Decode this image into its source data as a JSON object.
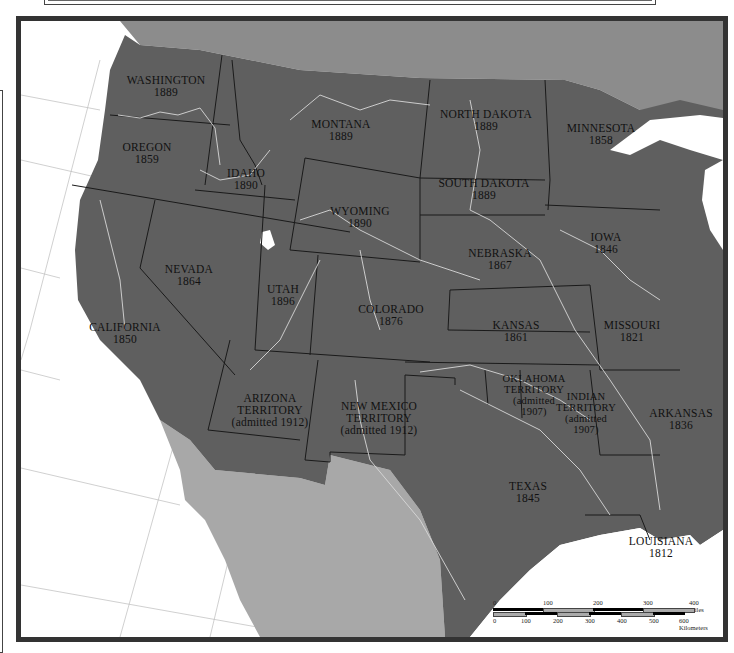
{
  "map": {
    "colors": {
      "us_land": "#5f5f5f",
      "canada_land": "#8c8c8c",
      "mexico_land": "#a8a8a8",
      "water": "#ffffff",
      "border": "#1a1a1a",
      "river": "#d8d8d8",
      "frame": "#333333"
    },
    "states": [
      {
        "id": "washington",
        "name": "WASHINGTON",
        "year": "1889"
      },
      {
        "id": "oregon",
        "name": "OREGON",
        "year": "1859"
      },
      {
        "id": "idaho",
        "name": "IDAHO",
        "year": "1890"
      },
      {
        "id": "montana",
        "name": "MONTANA",
        "year": "1889"
      },
      {
        "id": "north-dakota",
        "name": "NORTH DAKOTA",
        "year": "1889"
      },
      {
        "id": "minnesota",
        "name": "MINNESOTA",
        "year": "1858"
      },
      {
        "id": "south-dakota",
        "name": "SOUTH DAKOTA",
        "year": "1889"
      },
      {
        "id": "wyoming",
        "name": "WYOMING",
        "year": "1890"
      },
      {
        "id": "nevada",
        "name": "NEVADA",
        "year": "1864"
      },
      {
        "id": "utah",
        "name": "UTAH",
        "year": "1896"
      },
      {
        "id": "nebraska",
        "name": "NEBRASKA",
        "year": "1867"
      },
      {
        "id": "iowa",
        "name": "IOWA",
        "year": "1846"
      },
      {
        "id": "california",
        "name": "CALIFORNIA",
        "year": "1850"
      },
      {
        "id": "colorado",
        "name": "COLORADO",
        "year": "1876"
      },
      {
        "id": "kansas",
        "name": "KANSAS",
        "year": "1861"
      },
      {
        "id": "missouri",
        "name": "MISSOURI",
        "year": "1821"
      },
      {
        "id": "arizona",
        "name": "ARIZONA TERRITORY",
        "line1": "ARIZONA",
        "line2": "TERRITORY",
        "year": "(admitted 1912)"
      },
      {
        "id": "new-mexico",
        "name": "NEW MEXICO TERRITORY",
        "line1": "NEW MEXICO",
        "line2": "TERRITORY",
        "year": "(admitted 1912)"
      },
      {
        "id": "oklahoma",
        "name": "OKLAHOMA TERRITORY",
        "line1": "OKLAHOMA",
        "line2": "TERRITORY",
        "line3": "(admitted",
        "year": "1907)"
      },
      {
        "id": "indian-territory",
        "name": "INDIAN TERRITORY",
        "line1": "INDIAN",
        "line2": "TERRITORY",
        "line3": "(admitted",
        "year": "1907)"
      },
      {
        "id": "arkansas",
        "name": "ARKANSAS",
        "year": "1836"
      },
      {
        "id": "texas",
        "name": "TEXAS",
        "year": "1845"
      },
      {
        "id": "louisiana",
        "name": "LOUISIANA",
        "year": "1812"
      }
    ],
    "scale_bar": {
      "miles_ticks": [
        "0",
        "100",
        "200",
        "300",
        "400 Miles"
      ],
      "km_ticks": [
        "0",
        "100",
        "200",
        "300",
        "400",
        "500",
        "600 Kilometers"
      ]
    }
  }
}
